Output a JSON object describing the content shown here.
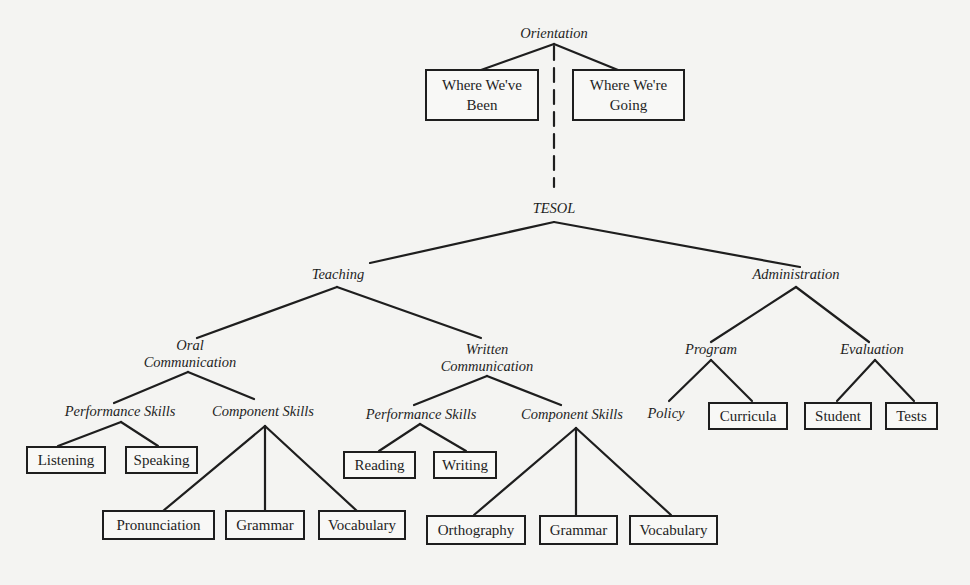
{
  "diagram": {
    "orientation": {
      "label": "Orientation",
      "children": [
        {
          "line1": "Where We've",
          "line2": "Been"
        },
        {
          "line1": "Where We're",
          "line2": "Going"
        }
      ]
    },
    "root": "TESOL",
    "teaching": {
      "label": "Teaching",
      "oral": {
        "line1": "Oral",
        "line2": "Communication",
        "performance": {
          "label": "Performance Skills",
          "items": [
            "Listening",
            "Speaking"
          ]
        },
        "component": {
          "label": "Component Skills",
          "items": [
            "Pronunciation",
            "Grammar",
            "Vocabulary"
          ]
        }
      },
      "written": {
        "line1": "Written",
        "line2": "Communication",
        "performance": {
          "label": "Performance Skills",
          "items": [
            "Reading",
            "Writing"
          ]
        },
        "component": {
          "label": "Component Skills",
          "items": [
            "Orthography",
            "Grammar",
            "Vocabulary"
          ]
        }
      }
    },
    "administration": {
      "label": "Administration",
      "program": {
        "label": "Program",
        "policy": "Policy",
        "curricula": "Curricula"
      },
      "evaluation": {
        "label": "Evaluation",
        "items": [
          "Student",
          "Tests"
        ]
      }
    }
  },
  "style": {
    "background": "#f4f4f2",
    "ink": "#1e1e1e"
  }
}
